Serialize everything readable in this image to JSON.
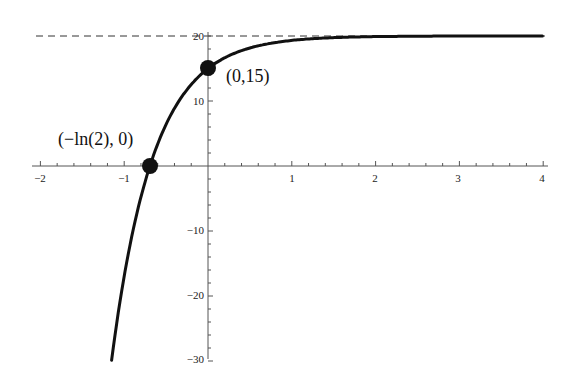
{
  "chart_data": {
    "type": "line",
    "title": "",
    "xlabel": "",
    "ylabel": "",
    "function": "y = 20 - 5e^(-2x)",
    "xlim": [
      -2.1,
      4.1
    ],
    "ylim": [
      -30,
      21
    ],
    "x_ticks": [
      -2,
      -1,
      1,
      2,
      3,
      4
    ],
    "x_tick_labels": [
      "-2",
      "-1",
      "1",
      "2",
      "3",
      "4"
    ],
    "y_ticks": [
      -30,
      -20,
      -10,
      10,
      20
    ],
    "y_tick_labels": [
      "-30",
      "-20",
      "-10",
      "10",
      "20"
    ],
    "grid": false,
    "series": [
      {
        "name": "f(x)",
        "x": [
          -1.15,
          -1.0,
          -0.8,
          -0.693,
          -0.5,
          -0.25,
          0,
          0.25,
          0.5,
          0.75,
          1.0,
          1.5,
          2.0,
          2.5,
          3.0,
          3.5,
          4.0
        ],
        "values": [
          -29.87,
          -16.95,
          -4.77,
          0.0,
          6.41,
          11.76,
          15.0,
          16.97,
          18.16,
          18.88,
          19.32,
          19.75,
          19.91,
          19.97,
          19.99,
          20.0,
          20.0
        ]
      }
    ],
    "asymptote": {
      "y": 20,
      "style": "dashed",
      "label": "y = 20"
    },
    "points": [
      {
        "x": 0,
        "y": 15,
        "label": "(0,15)"
      },
      {
        "x": -0.693,
        "y": 0,
        "label": "(−ln(2), 0)"
      }
    ]
  },
  "labels": {
    "point_intercept_y": "(0,15)",
    "point_intercept_x": "(−ln(2), 0)",
    "x_ticks": [
      "−2",
      "−1",
      "1",
      "2",
      "3",
      "4"
    ],
    "y_ticks": [
      "20",
      "10",
      "−10",
      "−20",
      "−30"
    ]
  }
}
